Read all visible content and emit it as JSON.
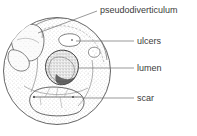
{
  "figure": {
    "style": "hand-drawn stippled line drawing",
    "colors": {
      "ink": "#4a4a4a",
      "label_text": "#3b3b3b",
      "leader_line": "#6d6d6d",
      "stipple": "#8c8c8c",
      "lumen_fill": "#6b6b6b",
      "background": "#ffffff"
    },
    "specimen": {
      "shape": "circle",
      "center_x": 57,
      "center_y": 71,
      "radius": 54
    }
  },
  "labels": [
    {
      "id": "pseudodiverticulum",
      "text": "pseudodiverticulum",
      "text_x": 100,
      "text_y": 13,
      "leader": "M97,11 L57,26 L38,33",
      "target": "upper-left pouch"
    },
    {
      "id": "ulcers",
      "text": "ulcers",
      "text_x": 137,
      "text_y": 44,
      "leader": "M134,41 L76,41",
      "target": "small mucosal defects"
    },
    {
      "id": "lumen",
      "text": "lumen",
      "text_x": 137,
      "text_y": 71,
      "leader": "M134,68 L78,68",
      "target": "central dark cavity"
    },
    {
      "id": "scar",
      "text": "scar",
      "text_x": 137,
      "text_y": 101,
      "leader": "M134,98 L82,98",
      "target": "fibrotic band"
    }
  ]
}
